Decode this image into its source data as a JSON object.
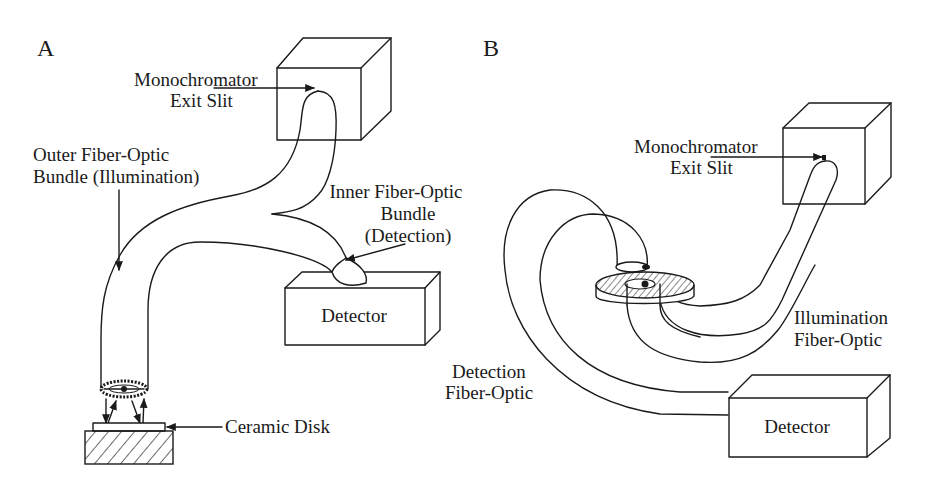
{
  "diagram": {
    "type": "schematic",
    "panels": [
      {
        "id": "A",
        "label": "A",
        "components": {
          "monochromator": {
            "label_line1": "Monochromator",
            "label_line2": "Exit Slit"
          },
          "outer_bundle": {
            "label_line1": "Outer Fiber-Optic",
            "label_line2": "Bundle (Illumination)"
          },
          "inner_bundle": {
            "label_line1": "Inner Fiber-Optic",
            "label_line2": "Bundle",
            "label_line3": "(Detection)"
          },
          "detector": {
            "label": "Detector"
          },
          "sample": {
            "label": "Ceramic Disk"
          }
        }
      },
      {
        "id": "B",
        "label": "B",
        "components": {
          "monochromator": {
            "label_line1": "Monochromator",
            "label_line2": "Exit Slit"
          },
          "illumination_fiber": {
            "label_line1": "Illumination",
            "label_line2": "Fiber-Optic"
          },
          "detection_fiber": {
            "label_line1": "Detection",
            "label_line2": "Fiber-Optic"
          },
          "detector": {
            "label": "Detector"
          }
        }
      }
    ],
    "colors": {
      "stroke": "#1a1a1a",
      "background": "#ffffff"
    }
  }
}
